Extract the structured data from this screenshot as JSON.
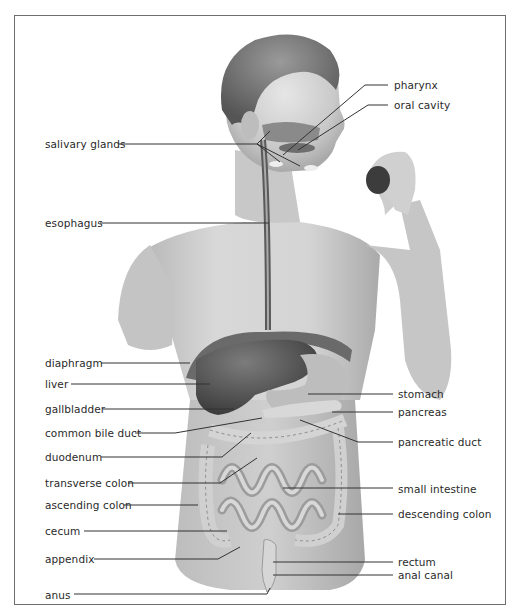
{
  "diagram": {
    "labels_left": [
      {
        "id": "salivary-glands",
        "text": "salivary glands",
        "x": 45,
        "y": 138
      },
      {
        "id": "esophagus",
        "text": "esophagus",
        "x": 45,
        "y": 217
      },
      {
        "id": "diaphragm",
        "text": "diaphragm",
        "x": 45,
        "y": 357
      },
      {
        "id": "liver",
        "text": "liver",
        "x": 45,
        "y": 378
      },
      {
        "id": "gallbladder",
        "text": "gallbladder",
        "x": 45,
        "y": 403
      },
      {
        "id": "common-bile-duct",
        "text": "common bile duct",
        "x": 45,
        "y": 427
      },
      {
        "id": "duodenum",
        "text": "duodenum",
        "x": 45,
        "y": 451
      },
      {
        "id": "transverse-colon",
        "text": "transverse colon",
        "x": 45,
        "y": 477
      },
      {
        "id": "ascending-colon",
        "text": "ascending colon",
        "x": 45,
        "y": 499
      },
      {
        "id": "cecum",
        "text": "cecum",
        "x": 45,
        "y": 525
      },
      {
        "id": "appendix",
        "text": "appendix",
        "x": 45,
        "y": 553
      },
      {
        "id": "anus",
        "text": "anus",
        "x": 45,
        "y": 589
      }
    ],
    "labels_right": [
      {
        "id": "pharynx",
        "text": "pharynx",
        "x": 394,
        "y": 79
      },
      {
        "id": "oral-cavity",
        "text": "oral cavity",
        "x": 394,
        "y": 99
      },
      {
        "id": "stomach",
        "text": "stomach",
        "x": 398,
        "y": 388
      },
      {
        "id": "pancreas",
        "text": "pancreas",
        "x": 398,
        "y": 406
      },
      {
        "id": "pancreatic-duct",
        "text": "pancreatic duct",
        "x": 398,
        "y": 436
      },
      {
        "id": "small-intestine",
        "text": "small intestine",
        "x": 398,
        "y": 483
      },
      {
        "id": "descending-colon",
        "text": "descending colon",
        "x": 398,
        "y": 508
      },
      {
        "id": "rectum",
        "text": "rectum",
        "x": 398,
        "y": 556
      },
      {
        "id": "anal-canal",
        "text": "anal canal",
        "x": 398,
        "y": 569
      }
    ],
    "colors": {
      "frame": "#6e6e6e",
      "leader": "#333333",
      "skin": "#d6d6d6",
      "skin_shadow": "#9a9a9a",
      "hair": "#7a7a7a",
      "liver": "#5a5a5a",
      "organ_light": "#c8c8c8",
      "intestine": "#b4b4b4"
    }
  }
}
